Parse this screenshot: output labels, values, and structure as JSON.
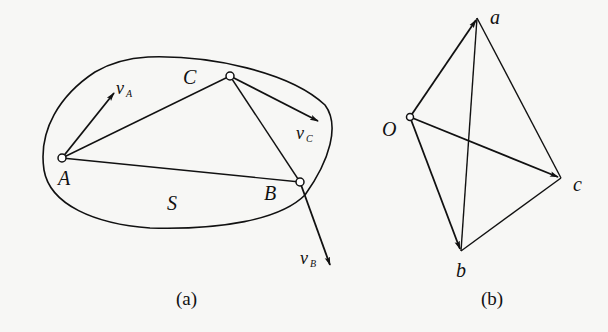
{
  "figure_a": {
    "caption": "(a)",
    "region_label": "S",
    "points": {
      "A": {
        "label": "A",
        "x": 62,
        "y": 158
      },
      "B": {
        "label": "B",
        "x": 300,
        "y": 182
      },
      "C": {
        "label": "C",
        "x": 230,
        "y": 76
      }
    },
    "velocities": {
      "vA": {
        "label": "v",
        "sub": "A"
      },
      "vB": {
        "label": "v",
        "sub": "B"
      },
      "vC": {
        "label": "v",
        "sub": "C"
      }
    }
  },
  "figure_b": {
    "caption": "(b)",
    "points": {
      "O": {
        "label": "O"
      },
      "a": {
        "label": "a"
      },
      "b": {
        "label": "b"
      },
      "c": {
        "label": "c"
      }
    }
  },
  "colors": {
    "ink": "#111111",
    "background": "#f7f7f5"
  }
}
